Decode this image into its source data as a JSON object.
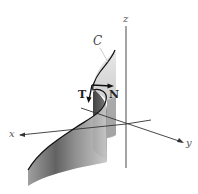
{
  "figure": {
    "type": "3d-space-curve-with-tangent-normal",
    "curve_label": "C",
    "vectors": [
      {
        "label": "T",
        "meaning": "unit tangent vector"
      },
      {
        "label": "N",
        "meaning": "principal unit normal vector"
      }
    ],
    "axes": {
      "x_label": "x",
      "y_label": "y",
      "z_label": "z"
    },
    "colors": {
      "background": "#ffffff",
      "axis": "#333333",
      "surface_dark": "#3a3a3a",
      "surface_light": "#d8d8d8",
      "curve": "#111111"
    }
  }
}
